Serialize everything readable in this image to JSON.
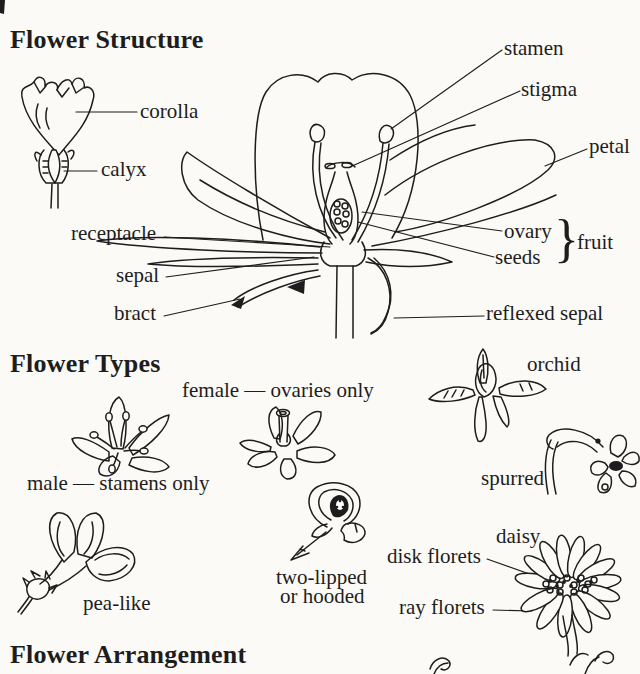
{
  "palette": {
    "background": "#fbfaf6",
    "ink": "#1d1d1d"
  },
  "structure": {
    "title": "Flower Structure",
    "labels": {
      "corolla": "corolla",
      "calyx": "calyx",
      "stamen": "stamen",
      "stigma": "stigma",
      "petal": "petal",
      "receptacle": "receptacle",
      "sepal": "sepal",
      "bract": "bract",
      "ovary": "ovary",
      "seeds": "seeds",
      "brace": "}",
      "fruit": "fruit",
      "reflexed_sepal": "reflexed sepal"
    }
  },
  "types": {
    "title": "Flower Types",
    "labels": {
      "female": "female — ovaries only",
      "male": "male — stamens only",
      "orchid": "orchid",
      "spurred": "spurred",
      "pea_like": "pea-like",
      "two_lipped_1": "two-lipped",
      "two_lipped_2": "or hooded",
      "daisy": "daisy",
      "disk_florets": "disk florets",
      "ray_florets": "ray florets"
    }
  },
  "arrangement": {
    "title": "Flower Arrangement"
  }
}
